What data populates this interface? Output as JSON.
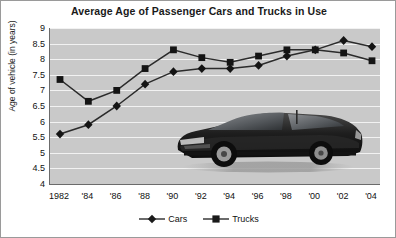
{
  "chart_data": {
    "type": "line",
    "title": "Average Age of Passenger Cars and Trucks in Use",
    "xlabel": "",
    "ylabel": "Age of vehicle (in years)",
    "x": [
      1982,
      1984,
      1986,
      1988,
      1990,
      1992,
      1994,
      1996,
      1998,
      2000,
      2002,
      2004
    ],
    "xtick_labels": [
      "1982",
      "'84",
      "'86",
      "'88",
      "'90",
      "'92",
      "'94",
      "'96",
      "'98",
      "'00",
      "'02",
      "'04"
    ],
    "ytick_labels": [
      "9",
      "8.5",
      "8",
      "7.5",
      "7",
      "6.5",
      "6",
      "5.5",
      "5",
      "4.5",
      "4"
    ],
    "ytick_values": [
      9,
      8.5,
      8,
      7.5,
      7,
      6.5,
      6,
      5.5,
      5,
      4.5,
      4
    ],
    "ylim": [
      4,
      9
    ],
    "grid": true,
    "legend_position": "bottom",
    "series": [
      {
        "name": "Cars",
        "marker": "diamond",
        "color": "#2b2b2b",
        "values": [
          5.6,
          5.9,
          6.5,
          7.2,
          7.6,
          7.7,
          7.7,
          7.8,
          8.1,
          8.3,
          8.6,
          8.4
        ]
      },
      {
        "name": "Trucks",
        "marker": "square",
        "color": "#2b2b2b",
        "values": [
          7.35,
          6.65,
          7.0,
          7.7,
          8.3,
          8.05,
          7.9,
          8.1,
          8.3,
          8.3,
          8.2,
          7.95
        ]
      }
    ],
    "annotations": [
      {
        "name": "car-photograph",
        "description": "photograph of a dark sports car overlaid on plot area"
      }
    ],
    "colors": {
      "plot_background": "#c9c9c9",
      "gridline": "#f2f2f2",
      "axis": "#6b6b6b",
      "series": "#2b2b2b",
      "text": "#111111",
      "figure_background": "#ffffff",
      "border": "#9a9a9a"
    }
  },
  "legend": {
    "items": [
      {
        "label": "Cars",
        "marker": "diamond"
      },
      {
        "label": "Trucks",
        "marker": "square"
      }
    ]
  }
}
